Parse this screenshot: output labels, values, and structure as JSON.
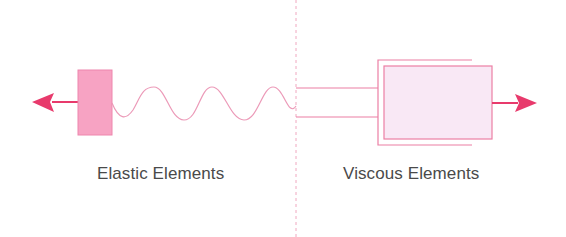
{
  "diagram": {
    "labels": {
      "elastic": "Elastic Elements",
      "viscous": "Viscous Elements"
    },
    "elements": [
      {
        "name": "left-arrow",
        "description": "force arrow pointing left"
      },
      {
        "name": "elastic-mass-block",
        "description": "pink filled block"
      },
      {
        "name": "spring",
        "description": "wavy spring line"
      },
      {
        "name": "divider",
        "description": "vertical dashed divider"
      },
      {
        "name": "piston-rod",
        "description": "two parallel lines of dashpot rod"
      },
      {
        "name": "dashpot-cylinder",
        "description": "open bracket cylinder"
      },
      {
        "name": "dashpot-piston",
        "description": "light pink piston box"
      },
      {
        "name": "right-arrow",
        "description": "force arrow pointing right"
      }
    ],
    "colors": {
      "arrow": "#e83a6c",
      "block_fill": "#f7a3c3",
      "block_stroke": "#ee86ad",
      "spring": "#ec9ab8",
      "divider": "#f0a8c0",
      "dashpot_stroke": "#ec7fa4",
      "dashpot_fill": "#f9e8f5"
    }
  }
}
